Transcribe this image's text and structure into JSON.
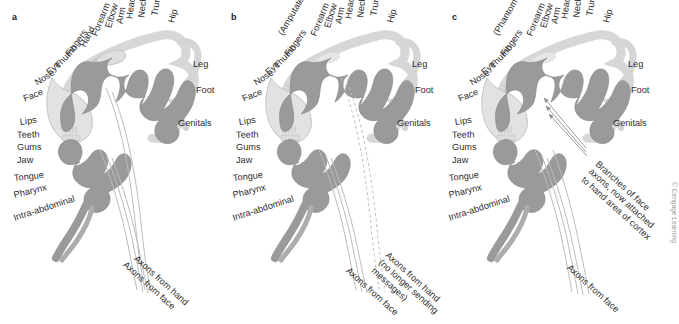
{
  "figure": {
    "copyright": "© Cengage Learning",
    "colors": {
      "cortex_ribbon": "#9a9a9a",
      "cortex_ribbon_dark": "#8a8a8a",
      "body_figure": "#d8d8d8",
      "body_figure_outline": "#b3b3b3",
      "axon_line": "#b9b9b9",
      "label_text": "#2e2e2e",
      "background": "#ffffff",
      "copyright_text": "#9b9b9b"
    }
  },
  "panels": [
    {
      "letter": "a",
      "name": "normal-cortex",
      "hand_label": "Hand",
      "body_labels": [
        "Intra-abdominal",
        "Pharynx",
        "Tongue",
        "Jaw",
        "Gums",
        "Teeth",
        "Lips",
        "Face",
        "Nose",
        "Eye",
        "Thumb",
        "Fingers",
        "Hand",
        "Forearm",
        "Elbow",
        "Arm",
        "Head",
        "Neck",
        "Trunk",
        "Hip",
        "Leg",
        "Foot",
        "Genitals"
      ],
      "axon_labels": [
        "Axons from hand",
        "Axons from face"
      ]
    },
    {
      "letter": "b",
      "name": "amputated-cortex",
      "hand_label": "(Amputated hand)",
      "body_labels": [
        "Intra-abdominal",
        "Pharynx",
        "Tongue",
        "Jaw",
        "Gums",
        "Teeth",
        "Lips",
        "Face",
        "Nose",
        "Eye",
        "Thumb",
        "Fingers",
        "(Amputated hand)",
        "Forearm",
        "Elbow",
        "Arm",
        "Head",
        "Neck",
        "Trunk",
        "Hip",
        "Leg",
        "Foot",
        "Genitals"
      ],
      "axon_labels": [
        "Axons from hand\n(no longer sending\nmessages)",
        "Axons from face"
      ]
    },
    {
      "letter": "c",
      "name": "reorganized-cortex",
      "hand_label": "(Phantom hand)",
      "body_labels": [
        "Intra-abdominal",
        "Pharynx",
        "Tongue",
        "Jaw",
        "Gums",
        "Teeth",
        "Lips",
        "Face",
        "Nose",
        "Eye",
        "Thumb",
        "Fingers",
        "(Phantom hand)",
        "Forearm",
        "Elbow",
        "Arm",
        "Head",
        "Neck",
        "Trunk",
        "Hip",
        "Leg",
        "Foot",
        "Genitals"
      ],
      "annotation": "Branches of face\naxons, now attached\nto hand area of cortex",
      "axon_labels": [
        "Axons from face"
      ]
    }
  ]
}
